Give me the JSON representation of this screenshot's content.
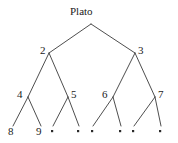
{
  "figure": {
    "type": "binary-tree-diagram",
    "width": 178,
    "height": 143,
    "background_color": "#ffffff",
    "edge_color": "#3a3a3a",
    "text_color": "#1a1a1a",
    "leaf_dot_color": "#2b2b2b"
  },
  "tree": {
    "root": {
      "id": "root",
      "label": "Plato",
      "x": 91,
      "y": 24,
      "label_x": 70,
      "label_y": 6
    },
    "level2": [
      {
        "id": "n2",
        "label": "2",
        "x": 49,
        "y": 53,
        "label_x": 40,
        "label_y": 45
      },
      {
        "id": "n3",
        "label": "3",
        "x": 135,
        "y": 53,
        "label_x": 138,
        "label_y": 45
      }
    ],
    "level3": [
      {
        "id": "n4",
        "label": "4",
        "x": 28,
        "y": 97,
        "label_x": 17,
        "label_y": 89
      },
      {
        "id": "n5",
        "label": "5",
        "x": 68,
        "y": 97,
        "label_x": 71,
        "label_y": 89
      },
      {
        "id": "n6",
        "label": "6",
        "x": 113,
        "y": 97,
        "label_x": 102,
        "label_y": 89
      },
      {
        "id": "n7",
        "label": "7",
        "x": 155,
        "y": 97,
        "label_x": 158,
        "label_y": 89
      }
    ],
    "leaves": [
      {
        "id": "leaf1",
        "label": "8",
        "kind": "number",
        "x": 12,
        "y": 133,
        "label_x": 8,
        "label_y": 126
      },
      {
        "id": "leaf2",
        "label": "9",
        "kind": "number",
        "x": 40,
        "y": 133,
        "label_x": 36,
        "label_y": 126
      },
      {
        "id": "leaf3",
        "label": "•",
        "kind": "dot",
        "x": 52,
        "y": 131,
        "label_x": 52,
        "label_y": 131
      },
      {
        "id": "leaf4",
        "label": "•",
        "kind": "dot",
        "x": 78,
        "y": 131,
        "label_x": 78,
        "label_y": 131
      },
      {
        "id": "leaf5",
        "label": "•",
        "kind": "dot",
        "x": 92,
        "y": 131,
        "label_x": 92,
        "label_y": 131
      },
      {
        "id": "leaf6",
        "label": "•",
        "kind": "dot",
        "x": 120,
        "y": 131,
        "label_x": 120,
        "label_y": 131
      },
      {
        "id": "leaf7",
        "label": "•",
        "kind": "dot",
        "x": 133,
        "y": 131,
        "label_x": 133,
        "label_y": 131
      },
      {
        "id": "leaf8",
        "label": "•",
        "kind": "dot",
        "x": 160,
        "y": 131,
        "label_x": 160,
        "label_y": 131
      }
    ],
    "edges": [
      {
        "from": "root",
        "to": "n2",
        "x1": 91,
        "y1": 24,
        "x2": 49,
        "y2": 53
      },
      {
        "from": "root",
        "to": "n3",
        "x1": 91,
        "y1": 24,
        "x2": 135,
        "y2": 53
      },
      {
        "from": "n2",
        "to": "n4",
        "x1": 49,
        "y1": 53,
        "x2": 28,
        "y2": 97
      },
      {
        "from": "n2",
        "to": "n5",
        "x1": 49,
        "y1": 53,
        "x2": 68,
        "y2": 97
      },
      {
        "from": "n3",
        "to": "n6",
        "x1": 135,
        "y1": 53,
        "x2": 113,
        "y2": 97
      },
      {
        "from": "n3",
        "to": "n7",
        "x1": 135,
        "y1": 53,
        "x2": 155,
        "y2": 97
      },
      {
        "from": "n4",
        "to": "leaf1",
        "x1": 28,
        "y1": 97,
        "x2": 13,
        "y2": 126
      },
      {
        "from": "n4",
        "to": "leaf2",
        "x1": 28,
        "y1": 97,
        "x2": 41,
        "y2": 126
      },
      {
        "from": "n5",
        "to": "leaf3",
        "x1": 68,
        "y1": 97,
        "x2": 53,
        "y2": 126
      },
      {
        "from": "n5",
        "to": "leaf4",
        "x1": 68,
        "y1": 97,
        "x2": 79,
        "y2": 126
      },
      {
        "from": "n6",
        "to": "leaf5",
        "x1": 113,
        "y1": 97,
        "x2": 93,
        "y2": 126
      },
      {
        "from": "n6",
        "to": "leaf6",
        "x1": 113,
        "y1": 97,
        "x2": 121,
        "y2": 126
      },
      {
        "from": "n7",
        "to": "leaf7",
        "x1": 155,
        "y1": 97,
        "x2": 134,
        "y2": 126
      },
      {
        "from": "n7",
        "to": "leaf8",
        "x1": 155,
        "y1": 97,
        "x2": 161,
        "y2": 126
      }
    ]
  }
}
